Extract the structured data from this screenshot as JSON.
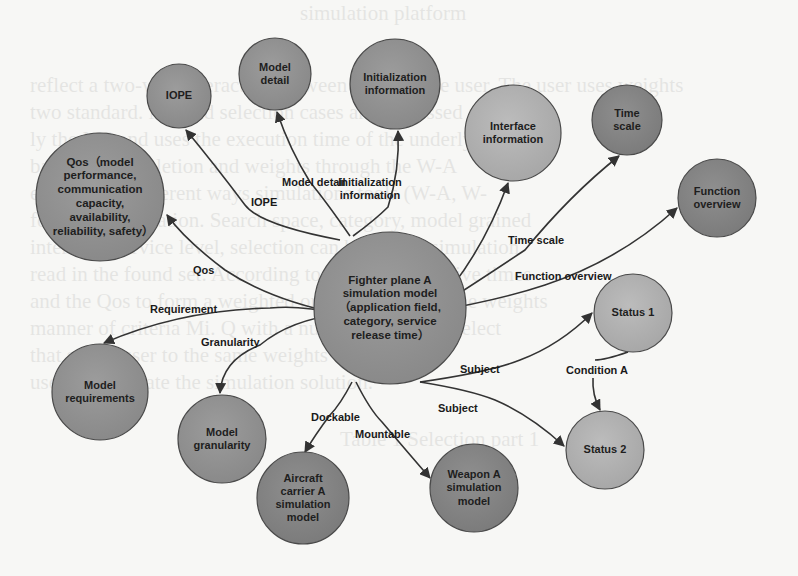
{
  "colors": {
    "background": "#f7f7f5",
    "node_dark": "#8a8a8a",
    "node_medium": "#969696",
    "node_light": "#b3b3b3",
    "node_stroke": "#4a4a4a",
    "edge": "#333333"
  },
  "background_bleed_text": [
    "simulation platform",
    "reflect a two-way interaction between MS and the user. The user uses weights",
    "two standard. MS and selection cases are expressed as",
    "ly the MS and uses the execution time of the underlying",
    "based on completion and weights through the W-A",
    "e (the three different ways simulations tools (W-A, W-",
    "found by simulation. Search space, category, model grained",
    "interface, service level, selection can be visible simulation",
    "read in the found set. According to the choices of five times",
    "and the Qos to form a weighted order by the user, the weights",
    "manner of criteria Mi. Q with a number so user to select",
    "that so the user to the same weights to the W-A",
    "used to calculate the simulation solution.",
    "Table 1  Selection part 1"
  ],
  "nodes": [
    {
      "id": "center",
      "label": "Fighter plane A simulation model（application field, category, service release time）",
      "cx": 390,
      "cy": 308,
      "r": 76,
      "shade": "medium"
    },
    {
      "id": "iope",
      "label": "IOPE",
      "cx": 179,
      "cy": 96,
      "r": 32,
      "shade": "medium"
    },
    {
      "id": "model-detail",
      "label": "Model detail",
      "cx": 275,
      "cy": 74,
      "r": 36,
      "shade": "medium"
    },
    {
      "id": "init-info",
      "label": "Initialization information",
      "cx": 395,
      "cy": 84,
      "r": 45,
      "shade": "medium"
    },
    {
      "id": "interface-info",
      "label": "Interface information",
      "cx": 513,
      "cy": 133,
      "r": 48,
      "shade": "light"
    },
    {
      "id": "time-scale",
      "label": "Time scale",
      "cx": 627,
      "cy": 120,
      "r": 35,
      "shade": "dark"
    },
    {
      "id": "function-overview",
      "label": "Function overview",
      "cx": 717,
      "cy": 198,
      "r": 39,
      "shade": "dark"
    },
    {
      "id": "qos",
      "label": "Qos（model performance, communication capacity, availability, reliability, safety）",
      "cx": 100,
      "cy": 197,
      "r": 64,
      "shade": "medium"
    },
    {
      "id": "status-1",
      "label": "Status 1",
      "cx": 633,
      "cy": 313,
      "r": 39,
      "shade": "light"
    },
    {
      "id": "status-2",
      "label": "Status 2",
      "cx": 605,
      "cy": 450,
      "r": 39,
      "shade": "light"
    },
    {
      "id": "model-requirements",
      "label": "Model requirements",
      "cx": 100,
      "cy": 392,
      "r": 48,
      "shade": "medium"
    },
    {
      "id": "model-granularity",
      "label": "Model granularity",
      "cx": 222,
      "cy": 439,
      "r": 44,
      "shade": "medium"
    },
    {
      "id": "aircraft-carrier",
      "label": "Aircraft carrier A simulation model",
      "cx": 303,
      "cy": 498,
      "r": 46,
      "shade": "dark"
    },
    {
      "id": "weapon-a",
      "label": "Weapon A simulation model",
      "cx": 474,
      "cy": 488,
      "r": 44,
      "shade": "dark"
    }
  ],
  "edges": [
    {
      "id": "iope",
      "label": "IOPE",
      "label_x": 251,
      "label_y": 196,
      "path": "M 340 240 Q 260 225 245 205 Q 215 165 186 130",
      "arrow_at": [
        186,
        130
      ],
      "arrow_dir": -2.2
    },
    {
      "id": "model-detail",
      "label": "Model detail",
      "label_x": 282,
      "label_y": 176,
      "path": "M 350 236 Q 325 200 310 182 Q 290 150 277 112",
      "arrow_at": [
        277,
        112
      ],
      "arrow_dir": -1.9
    },
    {
      "id": "init-info",
      "label": "Initialization information",
      "label_x": 330,
      "label_y": 176,
      "path": "M 353 236 Q 375 220 388 207 Q 400 170 398 131",
      "arrow_at": [
        398,
        131
      ],
      "arrow_dir": -1.55
    },
    {
      "id": "interface-info",
      "label": "",
      "label_x": 0,
      "label_y": 0,
      "path": "M 430 312 Q 480 260 508 183",
      "arrow_at": [
        508,
        183
      ],
      "arrow_dir": -1.2
    },
    {
      "id": "time-scale",
      "label": "Time scale",
      "label_x": 508,
      "label_y": 234,
      "path": "M 430 312 Q 480 280 525 250 Q 570 195 619 156",
      "arrow_at": [
        619,
        156
      ],
      "arrow_dir": -0.7
    },
    {
      "id": "function-overview",
      "label": "Function overview",
      "label_x": 515,
      "label_y": 270,
      "path": "M 430 312 Q 500 300 545 285 Q 620 260 677 208",
      "arrow_at": [
        677,
        208
      ],
      "arrow_dir": -0.6
    },
    {
      "id": "qos",
      "label": "Qos",
      "label_x": 193,
      "label_y": 264,
      "path": "M 340 314 Q 270 300 225 270 Q 185 240 167 215",
      "arrow_at": [
        167,
        215
      ],
      "arrow_dir": -2.2
    },
    {
      "id": "requirement",
      "label": "Requirement",
      "label_x": 150,
      "label_y": 303,
      "path": "M 340 314 Q 300 305 270 308 Q 180 310 104 343",
      "arrow_at": [
        104,
        343
      ],
      "arrow_dir": 2.7
    },
    {
      "id": "granularity",
      "label": "Granularity",
      "label_x": 201,
      "label_y": 336,
      "path": "M 340 314 Q 290 320 260 345 Q 222 360 220 393",
      "arrow_at": [
        220,
        393
      ],
      "arrow_dir": 1.6
    },
    {
      "id": "subject-1",
      "label": "Subject",
      "label_x": 460,
      "label_y": 363,
      "path": "M 420 382 Q 490 372 520 360 Q 560 345 592 313",
      "arrow_at": [
        592,
        313
      ],
      "arrow_dir": -0.75
    },
    {
      "id": "subject-2",
      "label": "Subject",
      "label_x": 438,
      "label_y": 402,
      "path": "M 420 382 Q 470 390 495 400 Q 530 415 564 446",
      "arrow_at": [
        564,
        446
      ],
      "arrow_dir": 0.5
    },
    {
      "id": "condition-a",
      "label": "Condition A",
      "label_x": 566,
      "label_y": 364,
      "path": "M 628 352 Q 605 360 595 360 M 593 378 Q 592 395 600 410",
      "arrow_at": [
        600,
        410
      ],
      "arrow_dir": 1.4
    },
    {
      "id": "dockable",
      "label": "Dockable",
      "label_x": 311,
      "label_y": 411,
      "path": "M 352 382 Q 340 405 330 415 Q 315 435 305 452",
      "arrow_at": [
        305,
        452
      ],
      "arrow_dir": 2.0
    },
    {
      "id": "mountable",
      "label": "Mountable",
      "label_x": 355,
      "label_y": 428,
      "path": "M 356 382 Q 370 410 382 422 Q 410 455 430 478",
      "arrow_at": [
        430,
        478
      ],
      "arrow_dir": 0.75
    }
  ]
}
